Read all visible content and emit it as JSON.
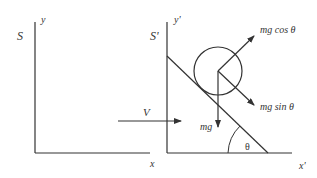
{
  "diagram": {
    "frame_s": {
      "name": "S",
      "x_axis_label": "x",
      "y_axis_label": "y"
    },
    "frame_s_prime": {
      "name": "S'",
      "x_axis_label": "x'",
      "y_axis_label": "y'"
    },
    "velocity_label": "V",
    "forces": {
      "weight": "mg",
      "normal_component": "mg cos θ",
      "parallel_component": "mg sin θ"
    },
    "angle_label": "θ",
    "colors": {
      "stroke": "#333333",
      "background": "#ffffff"
    }
  }
}
